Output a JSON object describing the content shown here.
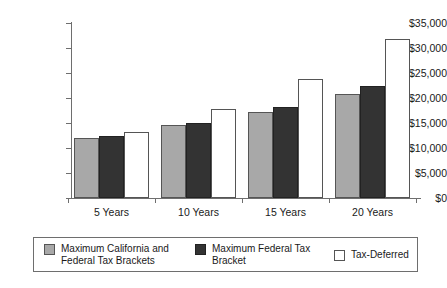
{
  "chart_data": {
    "type": "bar",
    "title": "",
    "xlabel": "",
    "ylabel": "",
    "ylim": [
      0,
      35000
    ],
    "grid": false,
    "legend_position": "bottom",
    "categories": [
      "5 Years",
      "10 Years",
      "15 Years",
      "20 Years"
    ],
    "ytick_labels": [
      "$0",
      "$5,000",
      "$10,000",
      "$15,000",
      "$20,000",
      "$25,000",
      "$30,000",
      "$35,000"
    ],
    "ytick_values": [
      0,
      5000,
      10000,
      15000,
      20000,
      25000,
      30000,
      35000
    ],
    "series": [
      {
        "name": "Maximum California and Federal Tax Brackets",
        "color": "#a8a8a8",
        "values": [
          12100,
          14600,
          17200,
          20800
        ]
      },
      {
        "name": "Maximum Federal Tax Bracket",
        "color": "#333333",
        "values": [
          12400,
          15000,
          18200,
          22400
        ]
      },
      {
        "name": "Tax-Deferred",
        "color": "#ffffff",
        "values": [
          13300,
          17800,
          23800,
          31800
        ]
      }
    ]
  },
  "legend": {
    "items": [
      {
        "label_line1": "Maximum California and",
        "label_line2": "Federal Tax Brackets",
        "swatch": "gray-swatch"
      },
      {
        "label_line1": "Maximum Federal Tax",
        "label_line2": "Bracket",
        "swatch": "dark-swatch"
      },
      {
        "label_line1": "Tax-Deferred",
        "label_line2": "",
        "swatch": "white-swatch"
      }
    ]
  }
}
